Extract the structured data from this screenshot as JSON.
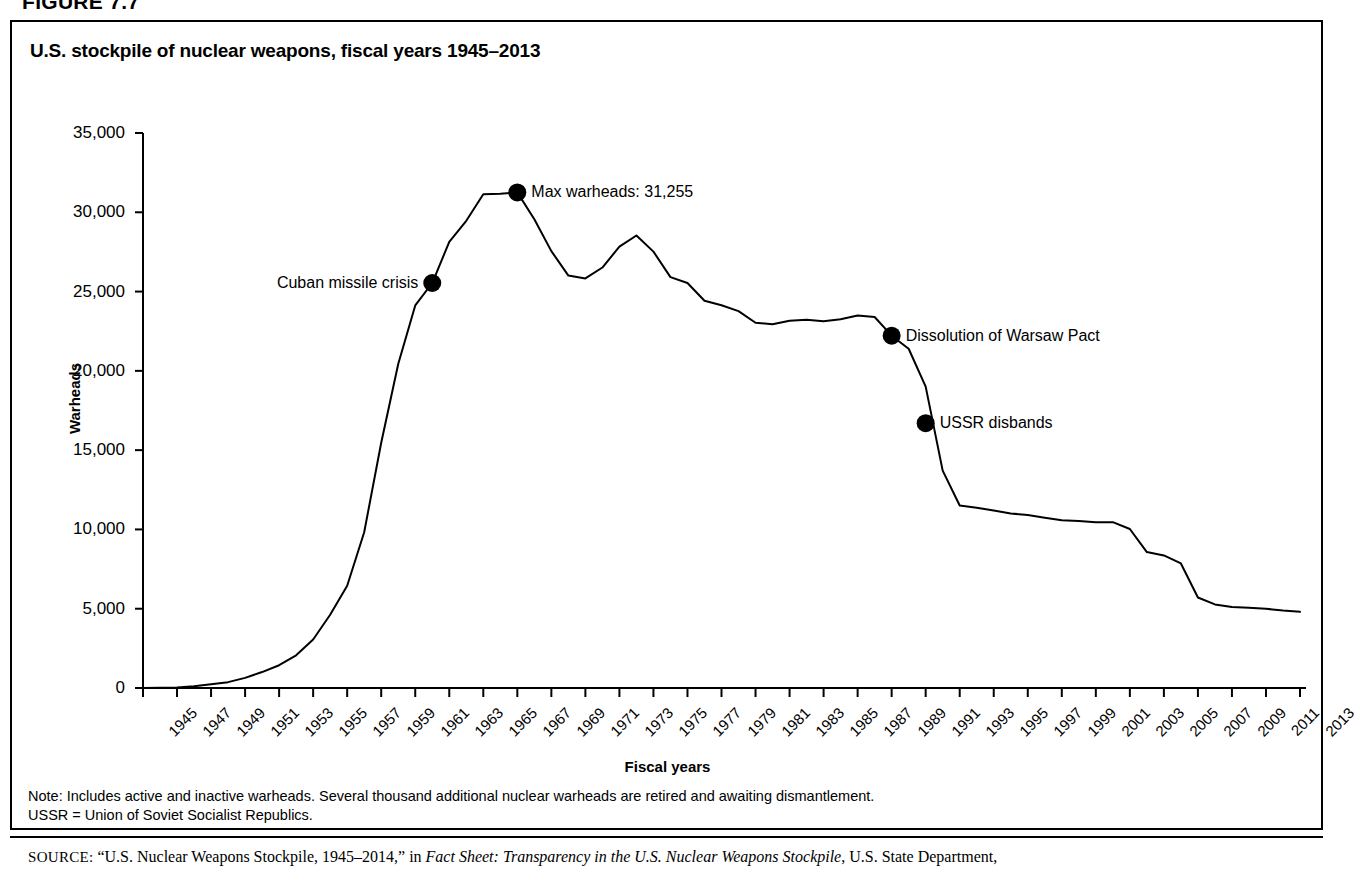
{
  "figure_number": "FIGURE 7.7",
  "chart_title": "U.S. stockpile of nuclear weapons, fiscal years 1945–2013",
  "notes": {
    "line1": "Note: Includes active and inactive warheads. Several thousand additional nuclear warheads are retired and awaiting dismantlement.",
    "line2": "USSR = Union of Soviet Socialist Republics."
  },
  "source": {
    "label": "SOURCE:",
    "part1": " “U.S. Nuclear Weapons Stockpile, 1945–2014,” in ",
    "italic1": "Fact Sheet: Transparency in the U.S. Nuclear Weapons Stockpile",
    "part2": ", U.S. State Department,"
  },
  "chart_data": {
    "type": "line",
    "title": "U.S. stockpile of nuclear weapons, fiscal years 1945–2013",
    "xlabel": "Fiscal years",
    "ylabel": "Warheads",
    "xlim": [
      1945,
      2013
    ],
    "ylim": [
      0,
      35000
    ],
    "grid": false,
    "legend": "none",
    "y_ticks": [
      0,
      5000,
      10000,
      15000,
      20000,
      25000,
      30000,
      35000
    ],
    "y_tick_labels": [
      "0",
      "5,000",
      "10,000",
      "15,000",
      "20,000",
      "25,000",
      "30,000",
      "35,000"
    ],
    "x_ticks": [
      1945,
      1947,
      1949,
      1951,
      1953,
      1955,
      1957,
      1959,
      1961,
      1963,
      1965,
      1967,
      1969,
      1971,
      1973,
      1975,
      1977,
      1979,
      1981,
      1983,
      1985,
      1987,
      1989,
      1991,
      1993,
      1995,
      1997,
      1999,
      2001,
      2003,
      2005,
      2007,
      2009,
      2011,
      2013
    ],
    "x_tick_labels": [
      "1945",
      "1947",
      "1949",
      "1951",
      "1953",
      "1955",
      "1957",
      "1959",
      "1961",
      "1963",
      "1965",
      "1967",
      "1969",
      "1971",
      "1973",
      "1975",
      "1977",
      "1979",
      "1981",
      "1983",
      "1985",
      "1987",
      "1989",
      "1991",
      "1993",
      "1995",
      "1997",
      "1999",
      "2001",
      "2003",
      "2005",
      "2007",
      "2009",
      "2011",
      "2013"
    ],
    "x": [
      1945,
      1946,
      1947,
      1948,
      1949,
      1950,
      1951,
      1952,
      1953,
      1954,
      1955,
      1956,
      1957,
      1958,
      1959,
      1960,
      1961,
      1962,
      1963,
      1964,
      1965,
      1966,
      1967,
      1968,
      1969,
      1970,
      1971,
      1972,
      1973,
      1974,
      1975,
      1976,
      1977,
      1978,
      1979,
      1980,
      1981,
      1982,
      1983,
      1984,
      1985,
      1986,
      1987,
      1988,
      1989,
      1990,
      1991,
      1992,
      1993,
      1994,
      1995,
      1996,
      1997,
      1998,
      1999,
      2000,
      2001,
      2002,
      2003,
      2004,
      2005,
      2006,
      2007,
      2008,
      2009,
      2010,
      2011,
      2012,
      2013
    ],
    "values": [
      6,
      11,
      32,
      110,
      235,
      369,
      640,
      1005,
      1436,
      2063,
      3057,
      4618,
      6444,
      9822,
      15468,
      20434,
      24126,
      25540,
      28133,
      29463,
      31139,
      31175,
      31255,
      29561,
      27552,
      26008,
      25830,
      26516,
      27835,
      28537,
      27519,
      25914,
      25542,
      24418,
      24138,
      23764,
      23031,
      22937,
      23154,
      23228,
      23135,
      23254,
      23490,
      23399,
      22217,
      21392,
      19008,
      13708,
      11511,
      11367,
      11194,
      11011,
      10903,
      10732,
      10577,
      10526,
      10456,
      10457,
      10027,
      8570,
      8360,
      7853,
      5709,
      5273,
      5113,
      5066,
      5000,
      4881,
      4804
    ],
    "annotations": [
      {
        "label": "Cuban missile crisis",
        "year": 1962,
        "value": 25540,
        "side": "left"
      },
      {
        "label": "Max warheads: 31,255",
        "year": 1967,
        "value": 31255,
        "side": "right"
      },
      {
        "label": "Dissolution of Warsaw Pact",
        "year": 1989,
        "value": 22217,
        "side": "right"
      },
      {
        "label": "USSR disbands",
        "year": 1991,
        "value": 16700,
        "side": "right"
      }
    ],
    "line_color": "#000000",
    "marker_color": "#000000"
  }
}
